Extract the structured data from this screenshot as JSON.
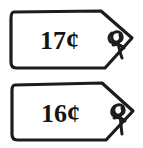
{
  "image": {
    "title": "Two hand-drawn price tags",
    "background_color": "#ffffff",
    "ink_color": "#1c1c1c",
    "width": 143,
    "height": 148
  },
  "tags": [
    {
      "id": "tag-top",
      "price_label": "17¢",
      "amount": 17,
      "currency_symbol": "¢",
      "hole_label": "tag-hole",
      "string_label": "tag-string"
    },
    {
      "id": "tag-bottom",
      "price_label": "16¢",
      "amount": 16,
      "currency_symbol": "¢",
      "hole_label": "tag-hole",
      "string_label": "tag-string"
    }
  ]
}
